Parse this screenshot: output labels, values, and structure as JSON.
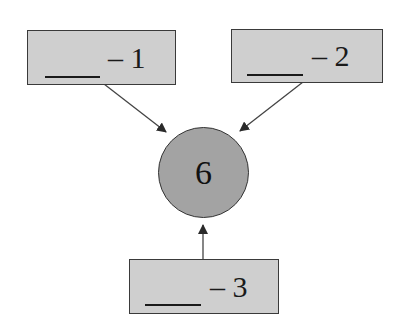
{
  "diagram": {
    "center": {
      "label": "6",
      "fill": "#a3a3a3"
    },
    "boxes": [
      {
        "id": "box-1",
        "label": "– 1",
        "blank": "____"
      },
      {
        "id": "box-2",
        "label": "– 2",
        "blank": "____"
      },
      {
        "id": "box-3",
        "label": "– 3",
        "blank": "____"
      }
    ],
    "box_fill": "#cfcfcf",
    "edges": [
      {
        "from": "box-1",
        "to": "center"
      },
      {
        "from": "box-2",
        "to": "center"
      },
      {
        "from": "box-3",
        "to": "center"
      }
    ]
  }
}
